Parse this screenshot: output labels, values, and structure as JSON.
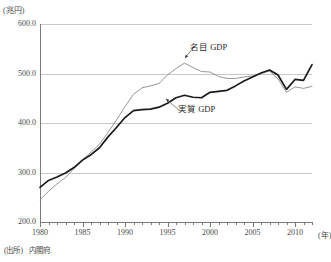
{
  "axes": {
    "y_unit_label": "(兆円)",
    "x_unit_label": "(年)",
    "y_ticks": [
      "600.0",
      "500.0",
      "400.0",
      "300.0",
      "200.0"
    ],
    "x_ticks": [
      "1980",
      "1985",
      "1990",
      "1995",
      "2000",
      "2005",
      "2010"
    ]
  },
  "annotations": {
    "nominal_label": "名目 GDP",
    "real_label": "実質 GDP"
  },
  "source": {
    "label": "(出所)",
    "text": "内閣府."
  },
  "colors": {
    "nominal_line": "#8a8a8a",
    "real_line": "#1a1a1a",
    "gridline": "#c8c8c8",
    "axis": "#7a7a7a",
    "text": "#3a3a3a"
  },
  "chart_data": {
    "type": "line",
    "title": "",
    "xlabel": "(年)",
    "ylabel": "(兆円)",
    "xlim": [
      1980,
      2012
    ],
    "ylim": [
      200,
      600
    ],
    "grid": true,
    "legend": "inline-annotations",
    "x": [
      1980,
      1981,
      1982,
      1983,
      1984,
      1985,
      1986,
      1987,
      1988,
      1989,
      1990,
      1991,
      1992,
      1993,
      1994,
      1995,
      1996,
      1997,
      1998,
      1999,
      2000,
      2001,
      2002,
      2003,
      2004,
      2005,
      2006,
      2007,
      2008,
      2009,
      2010,
      2011,
      2012
    ],
    "series": [
      {
        "name": "名目 GDP",
        "values": [
          245,
          262,
          277,
          290,
          308,
          326,
          341,
          357,
          381,
          406,
          433,
          458,
          471,
          475,
          480,
          497,
          510,
          521,
          512,
          504,
          503,
          494,
          490,
          490,
          493,
          495,
          500,
          505,
          489,
          462,
          473,
          470,
          474
        ]
      },
      {
        "name": "実質 GDP",
        "values": [
          270,
          284,
          291,
          299,
          310,
          325,
          336,
          350,
          372,
          391,
          411,
          425,
          427,
          428,
          432,
          440,
          451,
          456,
          452,
          451,
          462,
          464,
          466,
          475,
          485,
          493,
          501,
          507,
          497,
          468,
          488,
          486,
          518
        ]
      }
    ]
  }
}
